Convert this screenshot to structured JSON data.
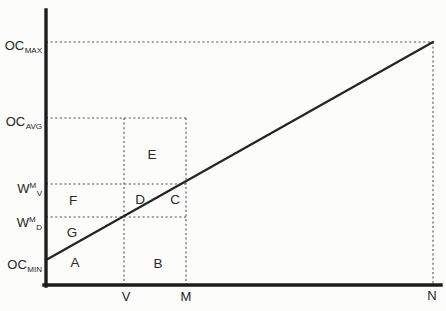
{
  "figure": {
    "background_color": "#fcfcfb",
    "axis_color": "#1d1d1d",
    "line_color": "#242424",
    "dash_color": "#4d4d4d",
    "y_axis_labels": {
      "oc_max": {
        "base": "OC",
        "sub": "MAX"
      },
      "oc_avg": {
        "base": "OC",
        "sub": "AVG"
      },
      "w_m_v": {
        "base": "W",
        "sup": "M",
        "sub": "V"
      },
      "w_m_d": {
        "base": "W",
        "sup": "M",
        "sub": "D"
      },
      "oc_min": {
        "base": "OC",
        "sub": "MIN"
      }
    },
    "x_axis_labels": {
      "v": "V",
      "m": "M",
      "n": "N"
    },
    "region_labels": {
      "a": "A",
      "b": "B",
      "c": "C",
      "d": "D",
      "e": "E",
      "f": "F",
      "g": "G"
    }
  }
}
